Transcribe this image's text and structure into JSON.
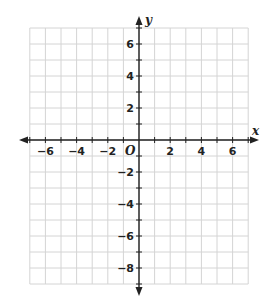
{
  "chart_data": {
    "type": "scatter",
    "title": "",
    "subtitle": "",
    "xlabel": "x",
    "ylabel": "y",
    "origin_label": "O",
    "xlim": [
      -7,
      7
    ],
    "ylim": [
      -9,
      7
    ],
    "grid": true,
    "grid_step": 1,
    "x_ticks": [
      -6,
      -4,
      -2,
      2,
      4,
      6
    ],
    "x_tick_labels": [
      "−6",
      "−4",
      "−2",
      "2",
      "4",
      "6"
    ],
    "y_ticks": [
      6,
      4,
      2,
      -2,
      -4,
      -6,
      -8
    ],
    "y_tick_labels": [
      "6",
      "4",
      "2",
      "−2",
      "−4",
      "−6",
      "−8"
    ],
    "series": [],
    "legend": null,
    "colors": {
      "grid": "#d4d4d4",
      "axis": "#222222",
      "text": "#222222"
    }
  }
}
